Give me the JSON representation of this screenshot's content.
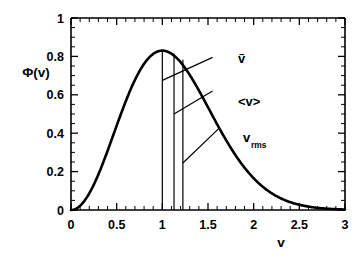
{
  "chart_data": {
    "type": "line",
    "title": "",
    "subtitle": "",
    "xlabel": "v",
    "ylabel": "Φ(v)",
    "xlim": [
      0,
      3
    ],
    "ylim": [
      0,
      1
    ],
    "grid": false,
    "legend": "none",
    "x_ticks": [
      "0",
      "0.5",
      "1",
      "1.5",
      "2",
      "2.5",
      "3"
    ],
    "x_tick_values": [
      0,
      0.5,
      1,
      1.5,
      2,
      2.5,
      3
    ],
    "x_minor_step": 0.1,
    "y_ticks": [
      "0",
      "0.2",
      "0.4",
      "0.6",
      "0.8",
      "1"
    ],
    "y_tick_values": [
      0,
      0.2,
      0.4,
      0.6,
      0.8,
      1
    ],
    "y_minor_step": 0.05,
    "series": [
      {
        "name": "Φ(v)",
        "description": "Maxwell-Boltzmann speed distribution, normalized so peak is at v = 1",
        "color": "#000000",
        "x": [
          0.0,
          0.05,
          0.1,
          0.15,
          0.2,
          0.25,
          0.3,
          0.35,
          0.4,
          0.45,
          0.5,
          0.55,
          0.6,
          0.65,
          0.7,
          0.75,
          0.8,
          0.85,
          0.9,
          0.95,
          1.0,
          1.05,
          1.1,
          1.15,
          1.2,
          1.25,
          1.3,
          1.35,
          1.4,
          1.45,
          1.5,
          1.55,
          1.6,
          1.65,
          1.7,
          1.75,
          1.8,
          1.85,
          1.9,
          1.95,
          2.0,
          2.1,
          2.2,
          2.3,
          2.4,
          2.5,
          2.6,
          2.7,
          2.8,
          2.9,
          3.0
        ],
        "y": [
          0.0,
          0.002,
          0.009,
          0.02,
          0.035,
          0.054,
          0.077,
          0.102,
          0.131,
          0.162,
          0.195,
          0.23,
          0.266,
          0.303,
          0.34,
          0.377,
          0.413,
          0.448,
          0.481,
          0.512,
          0.541,
          0.567,
          0.59,
          0.609,
          0.625,
          0.637,
          0.645,
          0.649,
          0.65,
          0.647,
          0.641,
          0.631,
          0.618,
          0.603,
          0.585,
          0.565,
          0.543,
          0.52,
          0.495,
          0.47,
          0.444,
          0.39,
          0.337,
          0.286,
          0.239,
          0.196,
          0.158,
          0.125,
          0.097,
          0.074,
          0.056
        ]
      }
    ],
    "peak": {
      "x": 1.0,
      "y": 0.83
    },
    "markers": [
      {
        "name": "most-probable-speed",
        "label": "ṽ",
        "label_plain": "v-tilde",
        "x": 1.0,
        "y_top": 0.83,
        "leader_from_y": 0.675,
        "leader_to": {
          "x": 1.55,
          "y": 0.795
        }
      },
      {
        "name": "mean-speed",
        "label": "<v>",
        "label_plain": "<v>",
        "x": 1.128,
        "y_top": 0.814,
        "leader_from_y": 0.5,
        "leader_to": {
          "x": 1.55,
          "y": 0.62
        }
      },
      {
        "name": "rms-speed",
        "label": "v",
        "label_sub": "rms",
        "label_plain": "v_rms",
        "x": 1.225,
        "y_top": 0.782,
        "leader_from_y": 0.245,
        "leader_to": {
          "x": 1.62,
          "y": 0.425
        }
      }
    ]
  },
  "axes": {
    "x_title": "v",
    "y_title": "Φ(v)"
  },
  "annotations": {
    "marker_1_label": "ṽ",
    "marker_2_label": "<v>",
    "marker_3_label": "v",
    "marker_3_sub": "rms"
  },
  "colors": {
    "curve": "#000000",
    "axis": "#000000",
    "background": "#ffffff"
  }
}
